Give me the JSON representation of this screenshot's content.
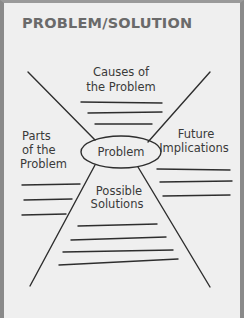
{
  "title": "PROBLEM/SOLUTION",
  "center": {
    "label": "Problem"
  },
  "sections": {
    "top": {
      "line1": "Causes of",
      "line2": "the Problem"
    },
    "left": {
      "line1": "Parts",
      "line2": "of the",
      "line3": "Problem"
    },
    "right": {
      "line1": "Future",
      "line2": "Implications"
    },
    "bottom": {
      "line1": "Possible",
      "line2": "Solutions"
    }
  },
  "colors": {
    "ink": "#2e2e2e",
    "title": "#6a6a6a",
    "background": "#efefef",
    "border": "#8a8a8a"
  }
}
